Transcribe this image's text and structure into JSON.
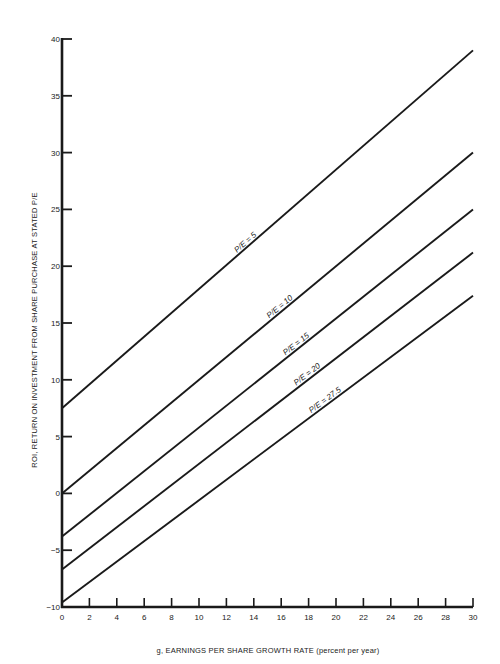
{
  "chart_data": {
    "type": "line",
    "title": "",
    "xlabel": "g, EARNINGS PER SHARE GROWTH RATE (percent per year)",
    "ylabel": "ROI, RETURN ON INVESTMENT FROM SHARE PURCHASE AT STATED P/E",
    "xlim": [
      0,
      30
    ],
    "ylim": [
      -10,
      40
    ],
    "xticks": [
      0,
      2,
      4,
      6,
      8,
      10,
      12,
      14,
      16,
      18,
      20,
      22,
      24,
      26,
      28,
      30
    ],
    "yticks": [
      -10,
      -5,
      0,
      5,
      10,
      15,
      20,
      25,
      30,
      35,
      40
    ],
    "ytick_labels": [
      "−10",
      "−5",
      "0",
      "5",
      "10",
      "15",
      "20",
      "25",
      "30",
      "35",
      "40"
    ],
    "grid": false,
    "legend": "inline labels on lines",
    "series": [
      {
        "name": "P/E = 5",
        "x": [
          0,
          30
        ],
        "values": [
          7.5,
          39.0
        ],
        "label_at_x": 13.5
      },
      {
        "name": "P/E = 10",
        "x": [
          0,
          30
        ],
        "values": [
          0.0,
          30.0
        ],
        "label_at_x": 16.0
      },
      {
        "name": "P/E = 15",
        "x": [
          0,
          30
        ],
        "values": [
          -3.8,
          25.0
        ],
        "label_at_x": 17.2
      },
      {
        "name": "P/E = 20",
        "x": [
          0,
          30
        ],
        "values": [
          -6.7,
          21.2
        ],
        "label_at_x": 18.0
      },
      {
        "name": "P/E = 27.5",
        "x": [
          0,
          30
        ],
        "values": [
          -9.6,
          17.4
        ],
        "label_at_x": 19.3
      }
    ]
  },
  "colors": {
    "line": "#1a1a1a",
    "axis": "#1a1a1a",
    "background": "#ffffff"
  }
}
